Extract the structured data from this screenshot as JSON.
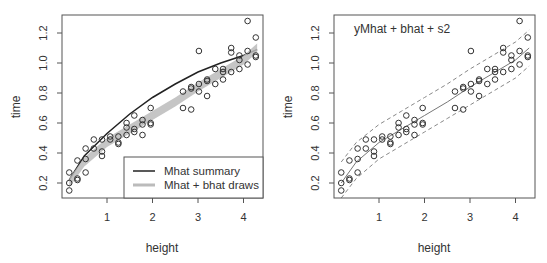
{
  "chart_data": [
    {
      "type": "scatter",
      "panel": "left",
      "title": "",
      "xlabel": "height",
      "ylabel": "time",
      "xlim": [
        0,
        4.4
      ],
      "ylim": [
        0.13,
        1.34
      ],
      "xticks": [
        "1",
        "2",
        "3",
        "4"
      ],
      "yticks": [
        "0.2",
        "0.4",
        "0.6",
        "0.8",
        "1.0",
        "1.2"
      ],
      "grid": false,
      "legend": {
        "position": "bottom-right",
        "entries": [
          {
            "label": "Mhat summary",
            "color": "#222222"
          },
          {
            "label": "Mhat + bhat draws",
            "color": "#bbbbbb"
          }
        ]
      },
      "series": [
        {
          "name": "observations",
          "kind": "points",
          "ref": "points"
        },
        {
          "name": "Mhat summary",
          "kind": "line",
          "color": "#222222",
          "x": [
            0.17,
            0.5,
            1,
            1.5,
            2,
            2.5,
            3,
            3.5,
            4,
            4.3
          ],
          "y": [
            0.22,
            0.38,
            0.53,
            0.66,
            0.77,
            0.86,
            0.94,
            1.0,
            1.05,
            1.09
          ]
        },
        {
          "name": "Mhat + bhat draws",
          "kind": "band",
          "color": "#bbbbbb",
          "x": [
            0.17,
            0.5,
            1,
            1.5,
            2,
            2.5,
            3,
            3.5,
            4,
            4.3
          ],
          "y": [
            0.2,
            0.34,
            0.47,
            0.56,
            0.65,
            0.74,
            0.84,
            0.93,
            1.02,
            1.1
          ],
          "halfwidth": 0.03
        }
      ]
    },
    {
      "type": "scatter",
      "panel": "right",
      "title": "",
      "annotation": "yMhat + bhat + s2",
      "xlabel": "height",
      "ylabel": "time",
      "xlim": [
        0,
        4.4
      ],
      "ylim": [
        0.13,
        1.34
      ],
      "xticks": [
        "1",
        "2",
        "3",
        "4"
      ],
      "yticks": [
        "0.2",
        "0.4",
        "0.6",
        "0.8",
        "1.0",
        "1.2"
      ],
      "grid": false,
      "series": [
        {
          "name": "observations",
          "kind": "points",
          "ref": "points"
        },
        {
          "name": "mean",
          "kind": "line",
          "style": "solid",
          "color": "#777777",
          "x": [
            0.17,
            0.5,
            1,
            1.5,
            2,
            2.5,
            3,
            3.5,
            4,
            4.3
          ],
          "y": [
            0.2,
            0.34,
            0.47,
            0.56,
            0.65,
            0.74,
            0.84,
            0.93,
            1.02,
            1.1
          ]
        },
        {
          "name": "upper",
          "kind": "line",
          "style": "dashed",
          "color": "#888888",
          "x": [
            0.17,
            0.5,
            1,
            1.5,
            2,
            2.5,
            3,
            3.5,
            4,
            4.3
          ],
          "y": [
            0.34,
            0.47,
            0.59,
            0.68,
            0.77,
            0.86,
            0.96,
            1.05,
            1.14,
            1.22
          ]
        },
        {
          "name": "lower",
          "kind": "line",
          "style": "dashed",
          "color": "#888888",
          "x": [
            0.17,
            0.5,
            1,
            1.5,
            2,
            2.5,
            3,
            3.5,
            4,
            4.3
          ],
          "y": [
            0.1,
            0.23,
            0.36,
            0.45,
            0.54,
            0.63,
            0.72,
            0.81,
            0.9,
            0.98
          ]
        }
      ]
    }
  ],
  "points": {
    "x": [
      0.17,
      0.17,
      0.17,
      0.35,
      0.35,
      0.35,
      0.53,
      0.53,
      0.53,
      0.71,
      0.71,
      0.89,
      0.89,
      0.89,
      1.07,
      1.07,
      1.25,
      1.25,
      1.25,
      1.43,
      1.43,
      1.43,
      1.6,
      1.6,
      1.6,
      1.78,
      1.78,
      1.78,
      1.96,
      1.96,
      1.96,
      2.67,
      2.67,
      2.85,
      2.85,
      2.85,
      3.02,
      3.02,
      3.02,
      3.2,
      3.2,
      3.2,
      3.38,
      3.38,
      3.55,
      3.55,
      3.55,
      3.73,
      3.73,
      3.73,
      3.91,
      3.91,
      3.91,
      4.09,
      4.09,
      4.09,
      4.27,
      4.27,
      4.27
    ],
    "y": [
      0.27,
      0.2,
      0.15,
      0.35,
      0.23,
      0.22,
      0.43,
      0.36,
      0.27,
      0.49,
      0.43,
      0.49,
      0.41,
      0.38,
      0.51,
      0.49,
      0.51,
      0.47,
      0.46,
      0.6,
      0.57,
      0.52,
      0.65,
      0.56,
      0.54,
      0.62,
      0.59,
      0.52,
      0.7,
      0.6,
      0.59,
      0.81,
      0.7,
      0.84,
      0.83,
      0.69,
      1.08,
      0.86,
      0.81,
      0.89,
      0.88,
      0.78,
      0.96,
      0.86,
      0.96,
      0.94,
      0.89,
      1.1,
      1.07,
      0.94,
      1.05,
      1.02,
      0.96,
      1.28,
      1.08,
      0.99,
      1.17,
      1.05,
      1.04
    ]
  },
  "labels": {
    "left_xlabel": "height",
    "left_ylabel": "time",
    "right_xlabel": "height",
    "right_ylabel": "time",
    "right_annotation": "yMhat + bhat + s2",
    "legend_1": "Mhat summary",
    "legend_2": "Mhat + bhat draws"
  }
}
